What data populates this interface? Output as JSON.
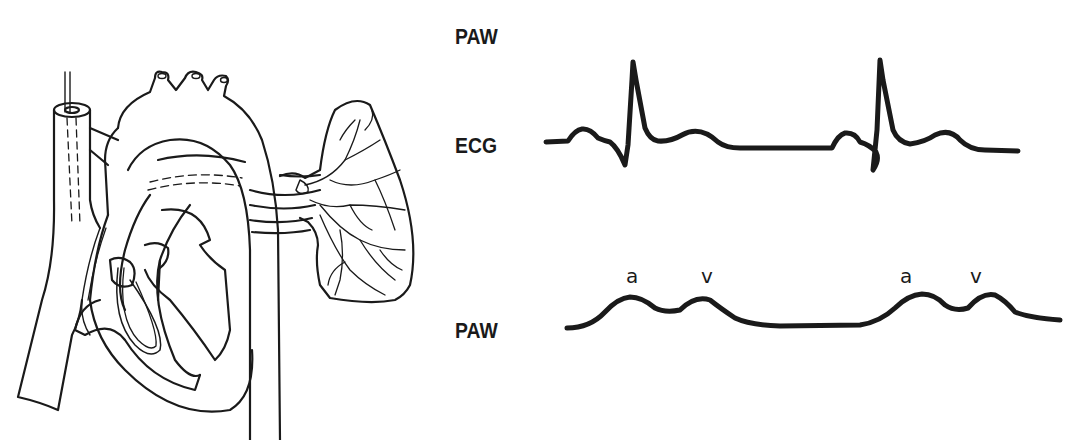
{
  "diagram": {
    "illustration": {
      "subject": "heart-with-pulmonary-artery-catheter",
      "structures": [
        "superior vena cava",
        "aortic arch",
        "right atrium",
        "right ventricle",
        "pulmonary artery",
        "lung",
        "descending aorta",
        "catheter"
      ]
    },
    "labels": {
      "top": "PAW",
      "ecg": "ECG",
      "paw": "PAW"
    },
    "waveforms": {
      "ecg": {
        "name": "ECG",
        "beats": 2
      },
      "paw": {
        "name": "PAW",
        "peak_labels": [
          "a",
          "v",
          "a",
          "v"
        ]
      }
    },
    "colors": {
      "ink": "#1a1a1a",
      "background": "#ffffff"
    }
  }
}
